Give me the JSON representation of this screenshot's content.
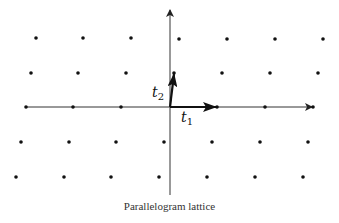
{
  "diagram": {
    "caption": "Parallelogram lattice",
    "vectors": {
      "t1": {
        "label": "t",
        "sub": "1"
      },
      "t2": {
        "label": "t",
        "sub": "2"
      }
    },
    "colors": {
      "dot": "#111111",
      "axis": "#222222",
      "caption": "#333333"
    },
    "origin": [
      170,
      107
    ],
    "t1_end": [
      217,
      107
    ],
    "t2_end": [
      174,
      73
    ],
    "lattice_points": [
      [
        36,
        38
      ],
      [
        83,
        38
      ],
      [
        131,
        38
      ],
      [
        179,
        39
      ],
      [
        227,
        39
      ],
      [
        275,
        39
      ],
      [
        323,
        39
      ],
      [
        31,
        73
      ],
      [
        78,
        73
      ],
      [
        126,
        73
      ],
      [
        174,
        73
      ],
      [
        222,
        73
      ],
      [
        270,
        73
      ],
      [
        318,
        73
      ],
      [
        26,
        107
      ],
      [
        73,
        107
      ],
      [
        121,
        107
      ],
      [
        217,
        107
      ],
      [
        265,
        107
      ],
      [
        313,
        107
      ],
      [
        21,
        142
      ],
      [
        69,
        142
      ],
      [
        116,
        142
      ],
      [
        164,
        142
      ],
      [
        212,
        142
      ],
      [
        260,
        142
      ],
      [
        308,
        142
      ],
      [
        16,
        177
      ],
      [
        64,
        177
      ],
      [
        111,
        177
      ],
      [
        159,
        177
      ],
      [
        207,
        177
      ],
      [
        255,
        177
      ],
      [
        303,
        177
      ]
    ]
  }
}
